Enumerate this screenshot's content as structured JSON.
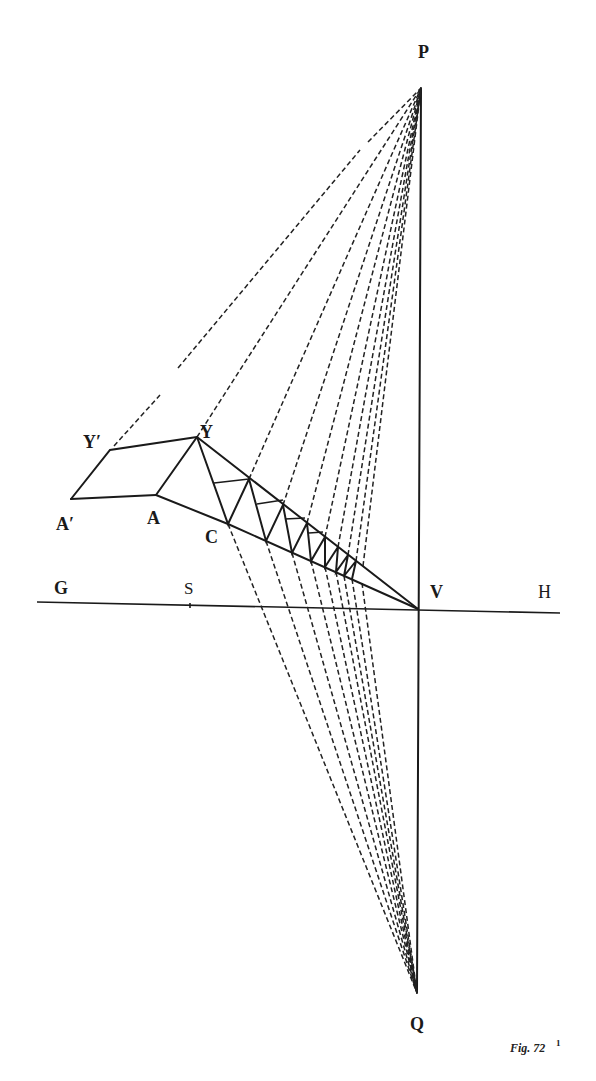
{
  "figure": {
    "caption": "Fig. 72",
    "caption_superscript": "1",
    "colors": {
      "ink": "#1a1a1a",
      "paper": "#ffffff"
    }
  },
  "labels": {
    "P": "P",
    "Q": "Q",
    "V": "V",
    "H": "H",
    "G": "G",
    "S": "S",
    "Y": "Y",
    "Y_prime": "Y′",
    "A": "A",
    "A_prime": "A′",
    "C": "C"
  },
  "points": {
    "P": [
      421,
      88
    ],
    "Q": [
      417,
      993
    ],
    "V": [
      418,
      609
    ],
    "Y": [
      197,
      437
    ],
    "Y_prime": [
      110,
      450
    ],
    "A": [
      156,
      495
    ],
    "A_prime": [
      71,
      499
    ],
    "C": [
      228,
      524
    ],
    "G_end": [
      37,
      602
    ],
    "H_end": [
      560,
      613
    ]
  }
}
